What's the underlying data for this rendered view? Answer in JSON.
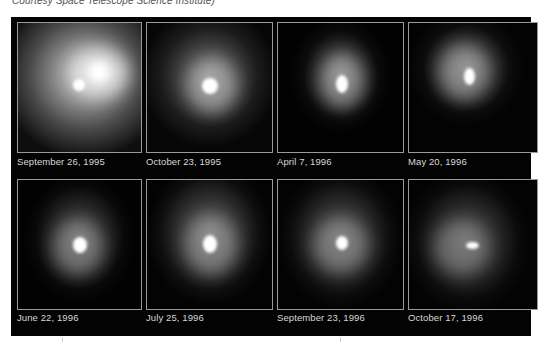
{
  "credit": "Courtesy Space Telescope Science Institute)",
  "figure": {
    "panels": [
      {
        "caption": "September 26, 1995"
      },
      {
        "caption": "October 23, 1995"
      },
      {
        "caption": "April 7, 1996"
      },
      {
        "caption": "May 20, 1996"
      },
      {
        "caption": "June 22, 1996"
      },
      {
        "caption": "July 25, 1996"
      },
      {
        "caption": "September 23, 1996"
      },
      {
        "caption": "October 17, 1996"
      }
    ]
  }
}
